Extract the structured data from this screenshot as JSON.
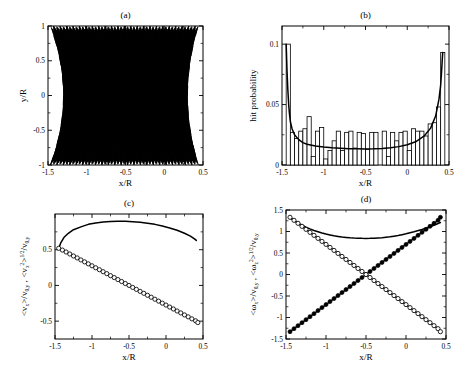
{
  "figure": {
    "width": 473,
    "height": 382,
    "background": "#ffffff",
    "ink": "#000000"
  },
  "panels": [
    {
      "id": "a",
      "label": "(a)",
      "xlabel": "x/R",
      "ylabel": "y/R",
      "xlim": [
        -1.5,
        0.5
      ],
      "ylim": [
        -1.0,
        1.0
      ],
      "xticks": [
        -1.5,
        -1,
        -0.5,
        0,
        0.5
      ],
      "xticklabels": [
        "-1.5",
        "-1",
        "-0.5",
        "0",
        "0.5"
      ],
      "yticks": [
        -1,
        -0.5,
        0,
        0.5,
        1
      ],
      "yticklabels": [
        "-1",
        "-0.5",
        "0",
        "0.5",
        "1"
      ],
      "xminor": [
        -1.25,
        -0.75,
        -0.25,
        0.25
      ],
      "yminor": [
        -0.75,
        -0.25,
        0.25,
        0.75
      ]
    },
    {
      "id": "b",
      "label": "(b)",
      "xlabel": "x/R",
      "ylabel": "hit probability",
      "xlim": [
        -1.5,
        0.5
      ],
      "ylim": [
        0,
        0.115
      ],
      "xticks": [
        -1.5,
        -1,
        -0.5,
        0,
        0.5
      ],
      "xticklabels": [
        "-1.5",
        "-1",
        "-0.5",
        "0",
        "0.5"
      ],
      "yticks": [
        0,
        0.05,
        0.1
      ],
      "yticklabels": [
        "0",
        "0.05",
        "0.1"
      ],
      "xminor": [
        -1.25,
        -0.75,
        -0.25,
        0.25
      ],
      "yminor": [
        0.025,
        0.075
      ]
    },
    {
      "id": "c",
      "label": "(c)",
      "xlabel": "x/R",
      "ylabel_parts": [
        "<v",
        "x",
        ">/v",
        "0,y",
        " , <v",
        "x",
        "2",
        ">",
        "1/2",
        "/v",
        "0,y"
      ],
      "xlim": [
        -1.5,
        0.5
      ],
      "ylim": [
        -0.75,
        1.0
      ],
      "xticks": [
        -1.5,
        -1,
        -0.5,
        0,
        0.5
      ],
      "xticklabels": [
        "-1.5",
        "-1",
        "-0.5",
        "0",
        "0.5"
      ],
      "yticks": [
        -0.5,
        0,
        0.5
      ],
      "yticklabels": [
        "-0.5",
        "0",
        "0.5"
      ],
      "xminor": [
        -1.25,
        -0.75,
        -0.25,
        0.25
      ],
      "yminor": [
        -0.25,
        0.25,
        0.75
      ]
    },
    {
      "id": "d",
      "label": "(d)",
      "xlabel": "x/R",
      "ylabel_parts": [
        "<ω",
        "x",
        ">/v",
        "0,y",
        " , <ω",
        "z",
        "2",
        ">",
        "1/2",
        "/v",
        "0,y"
      ],
      "xlim": [
        -1.5,
        0.5
      ],
      "ylim": [
        -1.5,
        1.5
      ],
      "xticks": [
        -1.5,
        -1,
        -0.5,
        0,
        0.5
      ],
      "xticklabels": [
        "-1.5",
        "-1",
        "-0.5",
        "0",
        "0.5"
      ],
      "yticks": [
        -1.5,
        -1,
        -0.5,
        0,
        0.5,
        1,
        1.5
      ],
      "yticklabels": [
        "-1.5",
        "-1",
        "-0.5",
        "0",
        "0.5",
        "1",
        "1.5"
      ],
      "xminor": [
        -1.25,
        -0.75,
        -0.25,
        0.25
      ],
      "yminor": [
        -1.25,
        -0.75,
        -0.25,
        0.25,
        0.75,
        1.25
      ]
    }
  ],
  "chart_data": [
    {
      "type": "line",
      "panel": "a",
      "title": "(a)",
      "xlabel": "x/R",
      "ylabel": "y/R",
      "xlim": [
        -1.5,
        0.5
      ],
      "ylim": [
        -1.0,
        1.0
      ],
      "grid": false,
      "legend": null,
      "description": "Dense bouncing-ball trajectory forming a criss-cross caustic lattice bounded by two curved envelopes; left envelope near x/R = -1.45, right envelope near x/R = 0.42, both bulging inward at y/R = 0.",
      "envelope_left_x_at_y": {
        "-1": -1.47,
        "-0.5": -1.38,
        "0": -1.3,
        "0.5": -1.38,
        "1": -1.47
      },
      "envelope_right_x_at_y": {
        "-1": 0.44,
        "-0.5": 0.36,
        "0": 0.3,
        "0.5": 0.36,
        "1": 0.44
      },
      "bounce_count_top": 23,
      "bounce_count_bottom": 23
    },
    {
      "type": "bar",
      "panel": "b",
      "title": "(b)",
      "xlabel": "x/R",
      "ylabel": "hit probability",
      "xlim": [
        -1.5,
        0.5
      ],
      "ylim": [
        0,
        0.115
      ],
      "grid": false,
      "bin_width": 0.05,
      "bin_centers": [
        -1.425,
        -1.375,
        -1.325,
        -1.275,
        -1.225,
        -1.175,
        -1.125,
        -1.075,
        -1.025,
        -0.975,
        -0.925,
        -0.875,
        -0.825,
        -0.775,
        -0.725,
        -0.675,
        -0.625,
        -0.575,
        -0.525,
        -0.475,
        -0.425,
        -0.375,
        -0.325,
        -0.275,
        -0.225,
        -0.175,
        -0.125,
        -0.075,
        -0.025,
        0.025,
        0.075,
        0.125,
        0.175,
        0.225,
        0.275,
        0.325,
        0.375,
        0.425
      ],
      "values": [
        0.1,
        0.027,
        0.022,
        0.028,
        0.03,
        0.04,
        0.007,
        0.028,
        0.031,
        0.005,
        0.012,
        0.02,
        0.028,
        0.012,
        0.027,
        0.028,
        0.014,
        0.027,
        0.026,
        0.013,
        0.027,
        0.027,
        0.0,
        0.028,
        0.007,
        0.027,
        0.02,
        0.027,
        0.028,
        0.012,
        0.03,
        0.028,
        0.028,
        0.024,
        0.034,
        0.035,
        0.048,
        0.093
      ],
      "overlay_curve": {
        "name": "analytic hit probability",
        "style": "solid black line",
        "x": [
          -1.45,
          -1.44,
          -1.43,
          -1.42,
          -1.41,
          -1.4,
          -1.38,
          -1.35,
          -1.3,
          -1.25,
          -1.2,
          -1.1,
          -1.0,
          -0.9,
          -0.8,
          -0.7,
          -0.6,
          -0.5,
          -0.4,
          -0.3,
          -0.2,
          -0.1,
          0.0,
          0.1,
          0.2,
          0.28,
          0.34,
          0.38,
          0.4,
          0.41,
          0.42,
          0.425
        ],
        "y": [
          0.1,
          0.078,
          0.062,
          0.05,
          0.042,
          0.036,
          0.03,
          0.025,
          0.021,
          0.0185,
          0.0172,
          0.0157,
          0.0148,
          0.0142,
          0.0138,
          0.0135,
          0.0134,
          0.0133,
          0.0134,
          0.0137,
          0.0142,
          0.0152,
          0.0167,
          0.0192,
          0.0238,
          0.0305,
          0.0405,
          0.0545,
          0.066,
          0.076,
          0.088,
          0.093
        ]
      }
    },
    {
      "type": "line",
      "panel": "c",
      "title": "(c)",
      "xlabel": "x/R",
      "ylabel": "<v_x>/v_{0,y} , <v_x^2>^{1/2}/v_{0,y}",
      "xlim": [
        -1.5,
        0.5
      ],
      "ylim": [
        -0.75,
        1.0
      ],
      "grid": false,
      "series": [
        {
          "name": "<v_x^2>^{1/2}/v_{0,y}",
          "style": "solid line, no markers",
          "x": [
            -1.45,
            -1.42,
            -1.38,
            -1.32,
            -1.25,
            -1.15,
            -1.05,
            -0.95,
            -0.85,
            -0.75,
            -0.65,
            -0.55,
            -0.5,
            -0.45,
            -0.35,
            -0.25,
            -0.15,
            -0.05,
            0.05,
            0.15,
            0.25,
            0.33,
            0.38,
            0.41
          ],
          "y": [
            0.52,
            0.6,
            0.67,
            0.73,
            0.78,
            0.82,
            0.855,
            0.875,
            0.888,
            0.895,
            0.898,
            0.897,
            0.896,
            0.893,
            0.885,
            0.872,
            0.855,
            0.832,
            0.805,
            0.772,
            0.73,
            0.69,
            0.655,
            0.63
          ]
        },
        {
          "name": "<v_x>/v_{0,y}",
          "style": "open circle markers",
          "x": [
            -1.45,
            -1.4,
            -1.35,
            -1.3,
            -1.25,
            -1.2,
            -1.15,
            -1.1,
            -1.05,
            -1.0,
            -0.95,
            -0.9,
            -0.85,
            -0.8,
            -0.75,
            -0.7,
            -0.65,
            -0.6,
            -0.55,
            -0.5,
            -0.45,
            -0.4,
            -0.35,
            -0.3,
            -0.25,
            -0.2,
            -0.15,
            -0.1,
            -0.05,
            0.0,
            0.05,
            0.1,
            0.15,
            0.2,
            0.25,
            0.3,
            0.35,
            0.4,
            0.43
          ],
          "y": [
            0.52,
            0.495,
            0.468,
            0.44,
            0.412,
            0.385,
            0.357,
            0.33,
            0.302,
            0.275,
            0.247,
            0.22,
            0.192,
            0.165,
            0.137,
            0.11,
            0.082,
            0.055,
            0.027,
            0.0,
            -0.028,
            -0.055,
            -0.083,
            -0.11,
            -0.138,
            -0.165,
            -0.193,
            -0.22,
            -0.248,
            -0.275,
            -0.303,
            -0.33,
            -0.358,
            -0.385,
            -0.413,
            -0.44,
            -0.468,
            -0.495,
            -0.52
          ]
        }
      ]
    },
    {
      "type": "line",
      "panel": "d",
      "title": "(d)",
      "xlabel": "x/R",
      "ylabel": "<ω_x>/v_{0,y} , <ω_z^2>^{1/2}/v_{0,y}",
      "xlim": [
        -1.5,
        0.5
      ],
      "ylim": [
        -1.5,
        1.5
      ],
      "grid": false,
      "series": [
        {
          "name": "<ω_z^2>^{1/2}/v_{0,y}",
          "style": "solid line, no markers",
          "x": [
            -1.45,
            -1.4,
            -1.35,
            -1.3,
            -1.25,
            -1.2,
            -1.15,
            -1.1,
            -1.05,
            -1.0,
            -0.95,
            -0.9,
            -0.85,
            -0.8,
            -0.75,
            -0.7,
            -0.65,
            -0.6,
            -0.55,
            -0.5,
            -0.45,
            -0.4,
            -0.35,
            -0.3,
            -0.25,
            -0.2,
            -0.15,
            -0.1,
            -0.05,
            0.0,
            0.1,
            0.2,
            0.3,
            0.38,
            0.43
          ],
          "y": [
            1.33,
            1.26,
            1.2,
            1.15,
            1.1,
            1.06,
            1.025,
            0.995,
            0.965,
            0.94,
            0.92,
            0.9,
            0.885,
            0.872,
            0.862,
            0.854,
            0.848,
            0.844,
            0.841,
            0.84,
            0.841,
            0.844,
            0.849,
            0.856,
            0.866,
            0.878,
            0.892,
            0.908,
            0.926,
            0.946,
            0.993,
            1.048,
            1.112,
            1.17,
            1.21
          ]
        },
        {
          "name": "<ω_x>/v_{0,y} (descending, open circles)",
          "style": "open circle markers",
          "x": [
            -1.45,
            -1.4,
            -1.35,
            -1.3,
            -1.25,
            -1.2,
            -1.15,
            -1.1,
            -1.05,
            -1.0,
            -0.95,
            -0.9,
            -0.85,
            -0.8,
            -0.75,
            -0.7,
            -0.65,
            -0.6,
            -0.55,
            -0.5,
            -0.45,
            -0.4,
            -0.35,
            -0.3,
            -0.25,
            -0.2,
            -0.15,
            -0.1,
            -0.05,
            0.0,
            0.05,
            0.1,
            0.15,
            0.2,
            0.25,
            0.3,
            0.35,
            0.4,
            0.43
          ],
          "y": [
            1.33,
            1.26,
            1.19,
            1.12,
            1.05,
            0.98,
            0.91,
            0.84,
            0.77,
            0.7,
            0.63,
            0.56,
            0.49,
            0.42,
            0.35,
            0.28,
            0.21,
            0.14,
            0.07,
            0.0,
            -0.07,
            -0.14,
            -0.21,
            -0.28,
            -0.35,
            -0.42,
            -0.49,
            -0.56,
            -0.63,
            -0.7,
            -0.77,
            -0.84,
            -0.91,
            -0.98,
            -1.05,
            -1.12,
            -1.19,
            -1.26,
            -1.33
          ]
        },
        {
          "name": "<ω_x>/v_{0,y} (ascending, filled circles)",
          "style": "filled circle markers",
          "x": [
            -1.45,
            -1.4,
            -1.35,
            -1.3,
            -1.25,
            -1.2,
            -1.15,
            -1.1,
            -1.05,
            -1.0,
            -0.95,
            -0.9,
            -0.85,
            -0.8,
            -0.75,
            -0.7,
            -0.65,
            -0.6,
            -0.55,
            -0.5,
            -0.45,
            -0.4,
            -0.35,
            -0.3,
            -0.25,
            -0.2,
            -0.15,
            -0.1,
            -0.05,
            0.0,
            0.05,
            0.1,
            0.15,
            0.2,
            0.25,
            0.3,
            0.35,
            0.4,
            0.43
          ],
          "y": [
            -1.33,
            -1.26,
            -1.19,
            -1.12,
            -1.05,
            -0.98,
            -0.91,
            -0.84,
            -0.77,
            -0.7,
            -0.63,
            -0.56,
            -0.49,
            -0.42,
            -0.35,
            -0.28,
            -0.21,
            -0.14,
            -0.07,
            0.0,
            0.07,
            0.14,
            0.21,
            0.28,
            0.35,
            0.42,
            0.49,
            0.56,
            0.63,
            0.7,
            0.77,
            0.84,
            0.91,
            0.98,
            1.05,
            1.12,
            1.19,
            1.26,
            1.33
          ]
        }
      ]
    }
  ]
}
